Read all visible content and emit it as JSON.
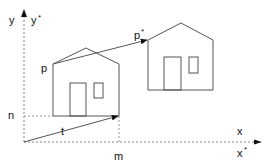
{
  "diagram": {
    "type": "2D translation of a house shape",
    "colors": {
      "line": "#555555",
      "axis": "#888888",
      "text": "#111111",
      "background": "#ffffff"
    },
    "axes": {
      "y_label": "y",
      "y_star_label": "y",
      "y_star_mark": "*",
      "x_label": "x",
      "x_star_label": "x",
      "x_star_mark": "*"
    },
    "points": {
      "p_label": "p",
      "p_star_label": "p",
      "p_star_mark": "*"
    },
    "vector": {
      "t_label": "t"
    },
    "offsets": {
      "n_label": "n",
      "m_label": "m"
    },
    "shapes": [
      {
        "name": "original-house"
      },
      {
        "name": "translated-house"
      }
    ]
  }
}
